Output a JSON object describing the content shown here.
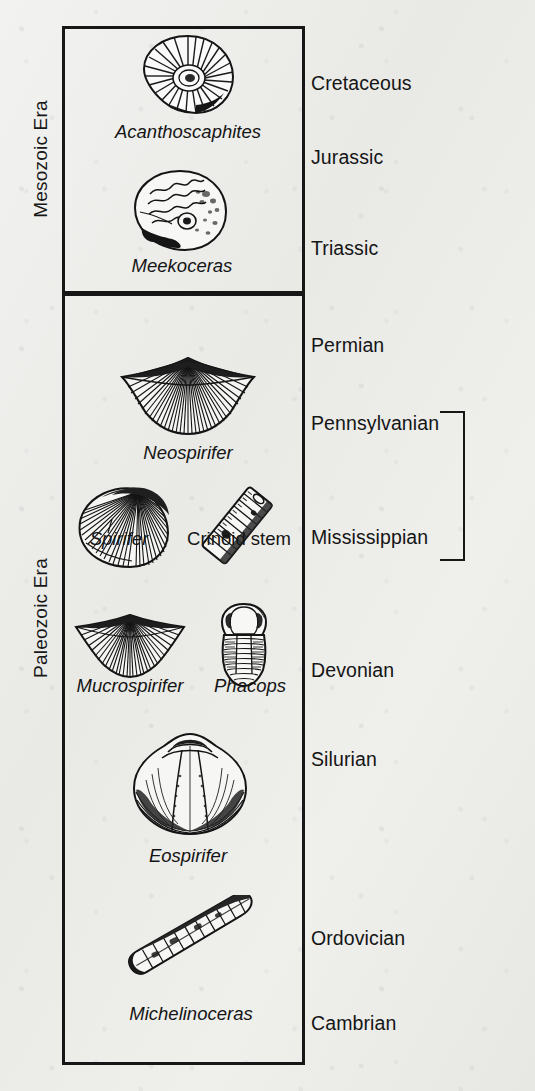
{
  "figure": {
    "ink_color": "#171717",
    "paper_color": "#eeeeec"
  },
  "eras": [
    {
      "id": "mesozoic",
      "label": "Mesozoic Era"
    },
    {
      "id": "paleozoic",
      "label": "Paleozoic Era"
    }
  ],
  "periods": [
    {
      "label": "Cretaceous",
      "era": "mesozoic"
    },
    {
      "label": "Jurassic",
      "era": "mesozoic"
    },
    {
      "label": "Triassic",
      "era": "mesozoic"
    },
    {
      "label": "Permian",
      "era": "paleozoic"
    },
    {
      "label": "Pennsylvanian",
      "era": "paleozoic"
    },
    {
      "label": "Mississippian",
      "era": "paleozoic"
    },
    {
      "label": "Devonian",
      "era": "paleozoic"
    },
    {
      "label": "Silurian",
      "era": "paleozoic"
    },
    {
      "label": "Ordovician",
      "era": "paleozoic"
    },
    {
      "label": "Cambrian",
      "era": "paleozoic"
    }
  ],
  "supergroup": {
    "label": "Carboniferous",
    "spans": [
      "Pennsylvanian",
      "Mississippian"
    ]
  },
  "fossils": [
    {
      "name": "Acanthoscaphites",
      "italic": true,
      "kind": "ammonite-ribbed"
    },
    {
      "name": "Meekoceras",
      "italic": true,
      "kind": "ammonite-smooth"
    },
    {
      "name": "Neospirifer",
      "italic": true,
      "kind": "brachiopod-fan-wide"
    },
    {
      "name": "Spirifer",
      "italic": true,
      "kind": "brachiopod-round"
    },
    {
      "name": "Crinoid stem",
      "italic": false,
      "kind": "crinoid-stem"
    },
    {
      "name": "Mucrospirifer",
      "italic": true,
      "kind": "brachiopod-fan-narrow"
    },
    {
      "name": "Phacops",
      "italic": true,
      "kind": "trilobite"
    },
    {
      "name": "Eospirifer",
      "italic": true,
      "kind": "brachiopod-oval"
    },
    {
      "name": "Michelinoceras",
      "italic": false,
      "kind": "nautiloid-cone"
    }
  ]
}
